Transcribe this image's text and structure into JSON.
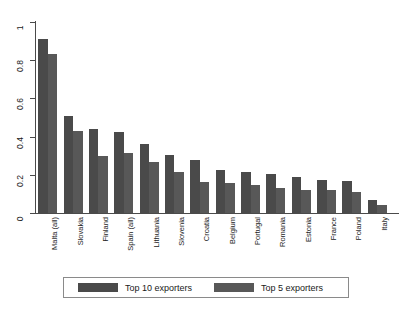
{
  "chart_data": {
    "type": "bar",
    "title": "",
    "subtitle": "",
    "xlabel": "",
    "ylabel": "",
    "ylim": [
      0,
      1
    ],
    "yticks": [
      "0",
      "0.2",
      "0.4",
      "0.6",
      "0.8",
      "1"
    ],
    "ytick_values": [
      0,
      0.2,
      0.4,
      0.6,
      0.8,
      1
    ],
    "grid": false,
    "legend_position": "bottom",
    "categories": [
      "Malta (all)",
      "Slovakia",
      "Finland",
      "Spain (all)",
      "Lithuania",
      "Slovenia",
      "Croatia",
      "Belgium",
      "Portugal",
      "Romania",
      "Estonia",
      "France",
      "Poland",
      "Italy"
    ],
    "series": [
      {
        "name": "Top 10 exporters",
        "color": "#4a4a4a",
        "values": [
          0.91,
          0.51,
          0.44,
          0.425,
          0.36,
          0.305,
          0.28,
          0.225,
          0.215,
          0.205,
          0.19,
          0.175,
          0.17,
          0.07
        ]
      },
      {
        "name": "Top 5 exporters",
        "color": "#585858",
        "values": [
          0.835,
          0.43,
          0.3,
          0.315,
          0.265,
          0.215,
          0.165,
          0.155,
          0.145,
          0.13,
          0.12,
          0.12,
          0.11,
          0.04
        ]
      }
    ]
  },
  "legend": {
    "items": [
      {
        "label": "Top 10 exporters"
      },
      {
        "label": "Top 5 exporters"
      }
    ]
  }
}
